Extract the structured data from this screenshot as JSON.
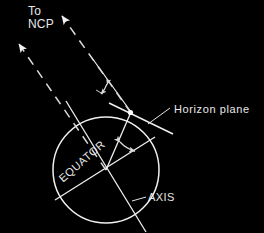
{
  "figure": {
    "background_color": "#000000",
    "line_color": "#f0f0f0",
    "text_color": "#e8e8e8",
    "width": 264,
    "height": 233
  },
  "labels": {
    "to_ncp": "To\nNCP",
    "horizon_plane": "Horizon plane",
    "axis": "AXIS",
    "equator": "EQUATOR"
  },
  "geometry": {
    "earth_circle": {
      "cx": 106,
      "cy": 170,
      "r": 53
    },
    "observer_point": {
      "x": 130,
      "y": 113
    },
    "axis_line": {
      "x1": 66,
      "y1": 101,
      "x2": 146,
      "y2": 232
    },
    "equator_line": {
      "x1": 56,
      "y1": 199,
      "x2": 154,
      "y2": 138
    },
    "horizon_plane_line": {
      "x1": 110,
      "y1": 104,
      "x2": 172,
      "y2": 134
    },
    "ncp_ray_from_observer": {
      "x1": 130,
      "y1": 113,
      "x2": 58,
      "y2": 12
    },
    "ncp_ray_from_center": {
      "x1": 106,
      "y1": 170,
      "x2": 14,
      "y2": 39
    },
    "observer_radius_line": {
      "x1": 106,
      "y1": 170,
      "x2": 130,
      "y2": 113
    }
  },
  "angles": [
    {
      "name": "altitude-of-ncp-angle",
      "description": "Angle between the horizon plane and the direction to the north celestial pole",
      "arc_center": {
        "x": 130,
        "y": 113
      },
      "radius": 30
    },
    {
      "name": "latitude-angle",
      "description": "Angle at Earth's centre between the equator plane and the observer's radius",
      "arc_center": {
        "x": 106,
        "y": 170
      },
      "radius": 32
    }
  ],
  "arrows": {
    "ncp_dashed_upper": {
      "tip_x": 58,
      "tip_y": 11
    },
    "ncp_dashed_lower": {
      "tip_x": 14,
      "tip_y": 38
    }
  }
}
